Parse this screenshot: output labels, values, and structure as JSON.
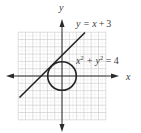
{
  "figure": {
    "type": "coordinate-graph",
    "axes": {
      "x_label": "x",
      "y_label": "y",
      "x_range": [
        -6,
        6
      ],
      "y_range": [
        -6,
        6
      ],
      "grid": true,
      "grid_step": 1
    },
    "curves": [
      {
        "name": "line",
        "equation_lhs": "y = x",
        "equation_op": "+",
        "equation_rhs": "3",
        "equation_full": "y = x + 3",
        "op_color": "#3aa84a",
        "from": [
          -6,
          -3
        ],
        "to": [
          3,
          6
        ]
      },
      {
        "name": "circle",
        "equation_full": "x² + y² = 4",
        "eq_x": "x",
        "eq_sup1": "2",
        "eq_plus": " + y",
        "eq_sup2": "2",
        "eq_rest": " = 4",
        "center": [
          0,
          0
        ],
        "radius": 2
      }
    ],
    "colors": {
      "grid": "#c8c8c8",
      "grid_minor": "#e0e0e0",
      "axis": "#2a2a2a",
      "curve": "#222222",
      "text": "#3a3a3a"
    }
  }
}
